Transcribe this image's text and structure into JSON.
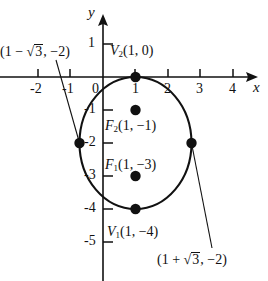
{
  "figure": {
    "type": "math-graph-ellipse",
    "axes": {
      "x_name": "x",
      "y_name": "y",
      "x_ticks": [
        "-2",
        "-1",
        "0",
        "1",
        "2",
        "3",
        "4"
      ],
      "y_ticks": [
        "1",
        "-1",
        "-2",
        "-3",
        "-4",
        "-5"
      ],
      "origin_label": "0",
      "x_range": [
        -2.9,
        4.9
      ],
      "y_range": [
        -5.9,
        1.6
      ]
    },
    "labels": {
      "left_point": "(1 − √3, −2)",
      "left_point_parts": {
        "open": "(1 − ",
        "radicand": "3",
        "close": ", −2)"
      },
      "right_point": "(1 + √3, −2)",
      "right_point_parts": {
        "open": "(1 + ",
        "radicand": "3",
        "close": ", −2)"
      },
      "vertex_top": "V₂(1, 0)",
      "focus_upper": "F₂(1, −1)",
      "focus_lower": "F₁(1, −3)",
      "vertex_bottom": "V₁(1, −4)"
    },
    "points": [
      {
        "name": "vertex-top",
        "label": "V2(1, 0)",
        "x": 1,
        "y": 0
      },
      {
        "name": "focus-upper",
        "label": "F2(1, -1)",
        "x": 1,
        "y": -1
      },
      {
        "name": "focus-lower",
        "label": "F1(1, -3)",
        "x": 1,
        "y": -3
      },
      {
        "name": "vertex-bottom",
        "label": "V1(1, -4)",
        "x": 1,
        "y": -4
      },
      {
        "name": "co-vertex-left",
        "label": "(1 - sqrt3, -2)",
        "x": -0.732,
        "y": -2
      },
      {
        "name": "co-vertex-right",
        "label": "(1 + sqrt3, -2)",
        "x": 2.732,
        "y": -2
      }
    ],
    "curve": {
      "kind": "ellipse",
      "center": [
        1,
        -2
      ],
      "semi_axis_x": 1.732,
      "semi_axis_y": 2
    },
    "colors": {
      "ink": "#111111",
      "background": "#ffffff"
    }
  }
}
